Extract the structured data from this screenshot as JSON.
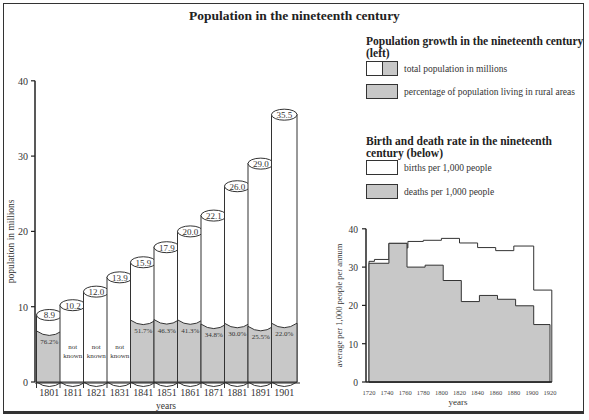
{
  "title": "Population in the nineteenth century",
  "legend": {
    "population": {
      "heading": "Population growth in the nineteenth century (left)",
      "items": [
        {
          "label": "total population in millions",
          "swatch": [
            "#ffffff",
            "#c8c8c8"
          ]
        },
        {
          "label": "percentage of population living in rural areas",
          "swatch": [
            "#c8c8c8"
          ]
        }
      ]
    },
    "rates": {
      "heading": "Birth and death rate in the nineteenth century (below)",
      "items": [
        {
          "label": "births per 1,000 people",
          "swatch": [
            "#ffffff"
          ]
        },
        {
          "label": "deaths per 1,000 people",
          "swatch": [
            "#c8c8c8"
          ]
        }
      ]
    }
  },
  "colors": {
    "rural_fill": "#c8c8c8",
    "total_fill": "#ffffff",
    "line": "#333333"
  },
  "chart_data": [
    {
      "type": "bar",
      "title": "Population growth in the nineteenth century",
      "xlabel": "years",
      "ylabel": "population in millions",
      "ylim": [
        0,
        40
      ],
      "yticks": [
        0,
        10,
        20,
        30,
        40
      ],
      "categories": [
        "1801",
        "1811",
        "1821",
        "1831",
        "1841",
        "1851",
        "1861",
        "1871",
        "1881",
        "1891",
        "1901"
      ],
      "series": [
        {
          "name": "total population in millions",
          "values": [
            8.9,
            10.2,
            12.0,
            13.9,
            15.9,
            17.9,
            20.0,
            22.1,
            26.0,
            29.0,
            35.5
          ],
          "labels": [
            "8.9",
            "10.2",
            "12.0",
            "13.9",
            "15.9",
            "17.9",
            "20.0",
            "22.1",
            "26.0",
            "29.0",
            "35.5"
          ]
        },
        {
          "name": "percentage of population living in rural areas",
          "values": [
            76.2,
            null,
            null,
            null,
            51.7,
            46.3,
            41.3,
            34.8,
            30.0,
            25.5,
            22.0
          ],
          "labels": [
            "76.2%",
            "not known",
            "not known",
            "not known",
            "51.7%",
            "46.3%",
            "41.3%",
            "34.8%",
            "30.0%",
            "25.5%",
            "22.0%"
          ]
        }
      ],
      "grid": false
    },
    {
      "type": "area",
      "title": "Birth and death rate in the nineteenth century",
      "xlabel": "years",
      "ylabel": "average per 1,000 people per annum",
      "ylim": [
        0,
        40
      ],
      "yticks": [
        0,
        10,
        20,
        30,
        40
      ],
      "xticks": [
        "1720",
        "1740",
        "1760",
        "1780",
        "1800",
        "1820",
        "1840",
        "1860",
        "1880",
        "1900",
        "1920"
      ],
      "x": [
        1720,
        1730,
        1740,
        1760,
        1770,
        1780,
        1800,
        1820,
        1840,
        1860,
        1880,
        1900,
        1910
      ],
      "series": [
        {
          "name": "births per 1,000 people",
          "steps": [
            [
              1720,
              1726,
              31.5
            ],
            [
              1726,
              1742,
              32
            ],
            [
              1742,
              1762,
              36.2
            ],
            [
              1762,
              1763,
              35
            ],
            [
              1763,
              1780,
              36.7
            ],
            [
              1780,
              1800,
              37
            ],
            [
              1800,
              1820,
              37.5
            ],
            [
              1820,
              1840,
              36.3
            ],
            [
              1840,
              1860,
              35.1
            ],
            [
              1860,
              1880,
              34.3
            ],
            [
              1880,
              1902,
              35.5
            ],
            [
              1902,
              1922,
              24
            ]
          ]
        },
        {
          "name": "deaths per 1,000 people",
          "steps": [
            [
              1720,
              1742,
              31
            ],
            [
              1742,
              1762,
              36.2
            ],
            [
              1762,
              1782,
              30
            ],
            [
              1782,
              1802,
              30.5
            ],
            [
              1802,
              1822,
              26.5
            ],
            [
              1822,
              1842,
              21
            ],
            [
              1842,
              1862,
              22.6
            ],
            [
              1862,
              1882,
              21.6
            ],
            [
              1882,
              1902,
              19.9
            ],
            [
              1902,
              1920,
              15
            ]
          ]
        }
      ],
      "grid": false
    }
  ]
}
